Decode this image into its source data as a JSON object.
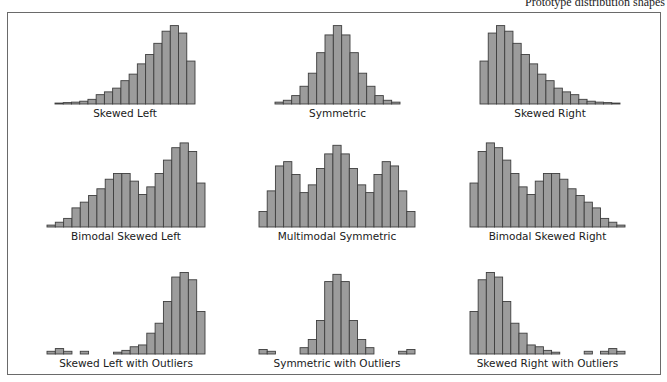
{
  "caption": "Prototype distribution shapes",
  "chart_data": [
    {
      "type": "bar",
      "title": "Skewed Left",
      "xlabel": "",
      "ylabel": "",
      "values": [
        1,
        1.5,
        2,
        3,
        5,
        10,
        13,
        17,
        25,
        32,
        43,
        53,
        65,
        78,
        84,
        76,
        46
      ],
      "ylim": [
        0,
        90
      ]
    },
    {
      "type": "bar",
      "title": "Symmetric",
      "xlabel": "",
      "ylabel": "",
      "values": [
        2,
        4,
        9,
        19,
        33,
        55,
        74,
        84,
        74,
        55,
        33,
        19,
        9,
        4,
        2
      ],
      "ylim": [
        0,
        90
      ]
    },
    {
      "type": "bar",
      "title": "Skewed Right",
      "xlabel": "",
      "ylabel": "",
      "values": [
        46,
        76,
        84,
        78,
        65,
        53,
        43,
        32,
        25,
        17,
        13,
        10,
        5,
        3,
        2,
        1.5,
        1
      ],
      "ylim": [
        0,
        90
      ]
    },
    {
      "type": "bar",
      "title": "Bimodal Skewed Left",
      "xlabel": "",
      "ylabel": "",
      "values": [
        2,
        5,
        9,
        20,
        26,
        33,
        40,
        50,
        56,
        56,
        48,
        34,
        42,
        56,
        70,
        83,
        88,
        79,
        46
      ],
      "ylim": [
        0,
        90
      ]
    },
    {
      "type": "bar",
      "title": "Multimodal Symmetric",
      "xlabel": "",
      "ylabel": "",
      "values": [
        18,
        42,
        71,
        76,
        61,
        40,
        49,
        68,
        85,
        95,
        85,
        68,
        49,
        40,
        61,
        76,
        71,
        42,
        18
      ],
      "ylim": [
        0,
        100
      ]
    },
    {
      "type": "bar",
      "title": "Bimodal Skewed Right",
      "xlabel": "",
      "ylabel": "",
      "values": [
        46,
        79,
        88,
        83,
        70,
        56,
        42,
        34,
        48,
        56,
        56,
        50,
        40,
        33,
        26,
        20,
        9,
        5,
        2
      ],
      "ylim": [
        0,
        90
      ]
    },
    {
      "type": "bar",
      "title": "Skewed Left with Outliers",
      "xlabel": "",
      "ylabel": "",
      "values": [
        3,
        6,
        3,
        0,
        3,
        0,
        0,
        0,
        2,
        4,
        8,
        10,
        23,
        34,
        58,
        85,
        90,
        82,
        47
      ],
      "ylim": [
        0,
        95
      ]
    },
    {
      "type": "bar",
      "title": "Symmetric with Outliers",
      "xlabel": "",
      "ylabel": "",
      "values": [
        5,
        3,
        0,
        0,
        0,
        7,
        16,
        37,
        80,
        88,
        80,
        37,
        16,
        7,
        0,
        0,
        0,
        3,
        5
      ],
      "ylim": [
        0,
        95
      ]
    },
    {
      "type": "bar",
      "title": "Skewed Right with Outliers",
      "xlabel": "",
      "ylabel": "",
      "values": [
        47,
        82,
        90,
        85,
        58,
        34,
        23,
        10,
        8,
        4,
        2,
        0,
        0,
        0,
        3,
        0,
        3,
        6,
        3
      ],
      "ylim": [
        0,
        95
      ]
    }
  ]
}
